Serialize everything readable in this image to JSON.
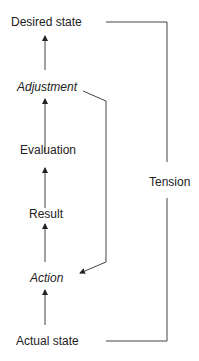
{
  "diagram": {
    "nodes": [
      {
        "id": "desired",
        "label": "Desired state",
        "italic": false
      },
      {
        "id": "adjustment",
        "label": "Adjustment",
        "italic": true
      },
      {
        "id": "evaluation",
        "label": "Evaluation",
        "italic": false
      },
      {
        "id": "result",
        "label": "Result",
        "italic": false
      },
      {
        "id": "action",
        "label": "Action",
        "italic": true
      },
      {
        "id": "actual",
        "label": "Actual state",
        "italic": false
      }
    ],
    "bracket_label": "Tension",
    "edges": [
      {
        "from": "actual",
        "to": "action"
      },
      {
        "from": "action",
        "to": "result"
      },
      {
        "from": "result",
        "to": "evaluation"
      },
      {
        "from": "evaluation",
        "to": "adjustment"
      },
      {
        "from": "adjustment",
        "to": "desired"
      },
      {
        "from": "adjustment",
        "to": "action",
        "type": "feedback"
      }
    ]
  }
}
